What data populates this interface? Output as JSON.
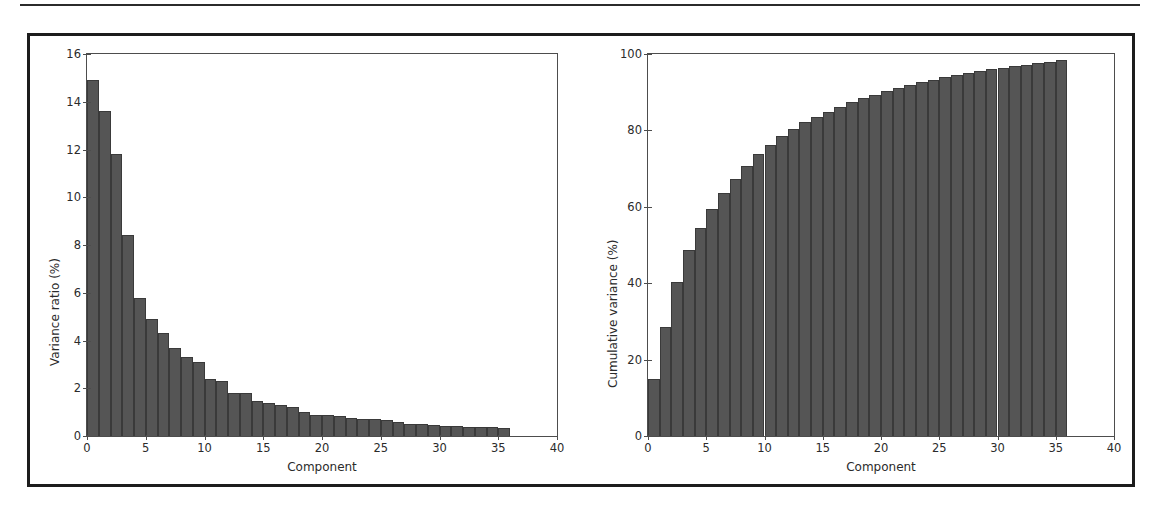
{
  "figure": {
    "panels": [
      {
        "id": "variance-ratio",
        "xlabel": "Component",
        "ylabel": "Variance ratio (%)"
      },
      {
        "id": "cumulative-variance",
        "xlabel": "Component",
        "ylabel": "Cumulative variance (%)"
      }
    ]
  },
  "colors": {
    "bar": "#555555",
    "bar_edge": "#3a3a3a",
    "axis": "#4d4d4d",
    "frame": "#1c1c1c",
    "text": "#2b2b2b",
    "background": "#ffffff"
  },
  "chart_data": [
    {
      "type": "bar",
      "id": "variance-ratio",
      "title": "",
      "xlabel": "Component",
      "ylabel": "Variance ratio (%)",
      "xlim": [
        0,
        40
      ],
      "ylim": [
        0,
        16
      ],
      "xticks": [
        0,
        5,
        10,
        15,
        20,
        25,
        30,
        35,
        40
      ],
      "xticklabels": [
        "0",
        "5",
        "10",
        "15",
        "20",
        "25",
        "30",
        "35",
        "40"
      ],
      "yticks": [
        0,
        2,
        4,
        6,
        8,
        10,
        12,
        14,
        16
      ],
      "yticklabels": [
        "0",
        "2",
        "4",
        "6",
        "8",
        "10",
        "12",
        "14",
        "16"
      ],
      "grid": false,
      "legend": null,
      "bar_width": 1,
      "x": [
        0,
        1,
        2,
        3,
        4,
        5,
        6,
        7,
        8,
        9,
        10,
        11,
        12,
        13,
        14,
        15,
        16,
        17,
        18,
        19,
        20,
        21,
        22,
        23,
        24,
        25,
        26,
        27,
        28,
        29,
        30,
        31,
        32,
        33,
        34,
        35
      ],
      "values": [
        14.9,
        13.6,
        11.8,
        8.4,
        5.8,
        4.9,
        4.3,
        3.7,
        3.3,
        3.1,
        2.4,
        2.3,
        1.8,
        1.8,
        1.45,
        1.4,
        1.3,
        1.2,
        1.0,
        0.9,
        0.9,
        0.85,
        0.75,
        0.72,
        0.72,
        0.65,
        0.6,
        0.52,
        0.5,
        0.45,
        0.42,
        0.42,
        0.38,
        0.38,
        0.38,
        0.35
      ]
    },
    {
      "type": "bar",
      "id": "cumulative-variance",
      "title": "",
      "xlabel": "Component",
      "ylabel": "Cumulative variance (%)",
      "xlim": [
        0,
        40
      ],
      "ylim": [
        0,
        100
      ],
      "xticks": [
        0,
        5,
        10,
        15,
        20,
        25,
        30,
        35,
        40
      ],
      "xticklabels": [
        "0",
        "5",
        "10",
        "15",
        "20",
        "25",
        "30",
        "35",
        "40"
      ],
      "yticks": [
        0,
        20,
        40,
        60,
        80,
        100
      ],
      "yticklabels": [
        "0",
        "20",
        "40",
        "60",
        "80",
        "100"
      ],
      "grid": false,
      "legend": null,
      "bar_width": 1,
      "x": [
        0,
        1,
        2,
        3,
        4,
        5,
        6,
        7,
        8,
        9,
        10,
        11,
        12,
        13,
        14,
        15,
        16,
        17,
        18,
        19,
        20,
        21,
        22,
        23,
        24,
        25,
        26,
        27,
        28,
        29,
        30,
        31,
        32,
        33,
        34,
        35
      ],
      "values": [
        14.9,
        28.5,
        40.3,
        48.7,
        54.5,
        59.4,
        63.7,
        67.4,
        70.7,
        73.8,
        76.2,
        78.5,
        80.3,
        82.1,
        83.55,
        84.95,
        86.25,
        87.45,
        88.45,
        89.35,
        90.25,
        91.1,
        91.85,
        92.57,
        93.29,
        93.94,
        94.54,
        95.06,
        95.56,
        96.01,
        96.43,
        96.85,
        97.23,
        97.61,
        97.99,
        98.34
      ]
    }
  ]
}
